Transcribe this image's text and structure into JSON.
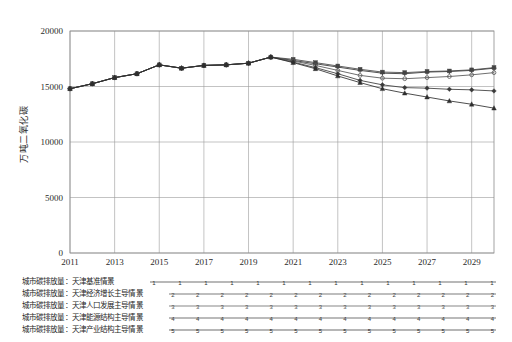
{
  "chart_data": {
    "type": "line",
    "title": "",
    "xlabel": "",
    "ylabel": "万吨二氧化碳",
    "ylim": [
      0,
      20000
    ],
    "ytick_labels": [
      "0",
      "5000",
      "10000",
      "15000",
      "20000"
    ],
    "ytick_values": [
      0,
      5000,
      10000,
      15000,
      20000
    ],
    "xlim": [
      2011,
      2030
    ],
    "xtick_labels": [
      "2011",
      "2013",
      "2015",
      "2017",
      "2019",
      "2021",
      "2023",
      "2025",
      "2027",
      "2029"
    ],
    "xtick_values": [
      2011,
      2013,
      2015,
      2017,
      2019,
      2021,
      2023,
      2025,
      2027,
      2029
    ],
    "x": [
      2011,
      2012,
      2013,
      2014,
      2015,
      2016,
      2017,
      2018,
      2019,
      2020,
      2021,
      2022,
      2023,
      2024,
      2025,
      2026,
      2027,
      2028,
      2029,
      2030
    ],
    "grid": "vertical-and-horizontal",
    "legend_position": "below",
    "series": [
      {
        "name": "城市碳排放量：天津基准情景",
        "marker": "plus",
        "color": "#333333",
        "values": [
          14800,
          15250,
          15800,
          16150,
          16950,
          16650,
          16900,
          16950,
          17100,
          17650,
          17350,
          17050,
          16750,
          16450,
          16200,
          16150,
          16300,
          16350,
          16450,
          16650
        ]
      },
      {
        "name": "城市碳排放量：天津经济增长主导情景",
        "marker": "square",
        "color": "#444444",
        "values": [
          14800,
          15250,
          15800,
          16150,
          16950,
          16650,
          16900,
          16950,
          17100,
          17650,
          17450,
          17150,
          16850,
          16550,
          16300,
          16250,
          16350,
          16400,
          16500,
          16700
        ]
      },
      {
        "name": "城市碳排放量：天津人口发展主导情景",
        "marker": "circle",
        "color": "#555555",
        "values": [
          14800,
          15250,
          15800,
          16150,
          16950,
          16650,
          16900,
          16950,
          17100,
          17650,
          17300,
          16900,
          16450,
          16000,
          15750,
          15700,
          15800,
          15900,
          16050,
          16250
        ]
      },
      {
        "name": "城市碳排放量：天津能源结构主导情景",
        "marker": "diamond",
        "color": "#3a3a3a",
        "values": [
          14800,
          15250,
          15800,
          16150,
          16950,
          16650,
          16900,
          16950,
          17100,
          17650,
          17200,
          16700,
          16150,
          15550,
          15150,
          14900,
          14850,
          14750,
          14700,
          14600
        ]
      },
      {
        "name": "城市碳排放量：天津产业结构主导情景",
        "marker": "triangle",
        "color": "#2e2e2e",
        "values": [
          14800,
          15250,
          15800,
          16150,
          16950,
          16650,
          16900,
          16950,
          17100,
          17650,
          17150,
          16600,
          15950,
          15350,
          14800,
          14400,
          14050,
          13700,
          13400,
          13050
        ]
      }
    ]
  },
  "legend": {
    "entries": [
      {
        "label": "城市碳排放量：天津基准情景"
      },
      {
        "label": "城市碳排放量：天津经济增长主导情景"
      },
      {
        "label": "城市碳排放量：天津人口发展主导情景"
      },
      {
        "label": "城市碳排放量：天津能源结构主导情景"
      },
      {
        "label": "城市碳排放量：天津产业结构主导情景"
      }
    ]
  }
}
